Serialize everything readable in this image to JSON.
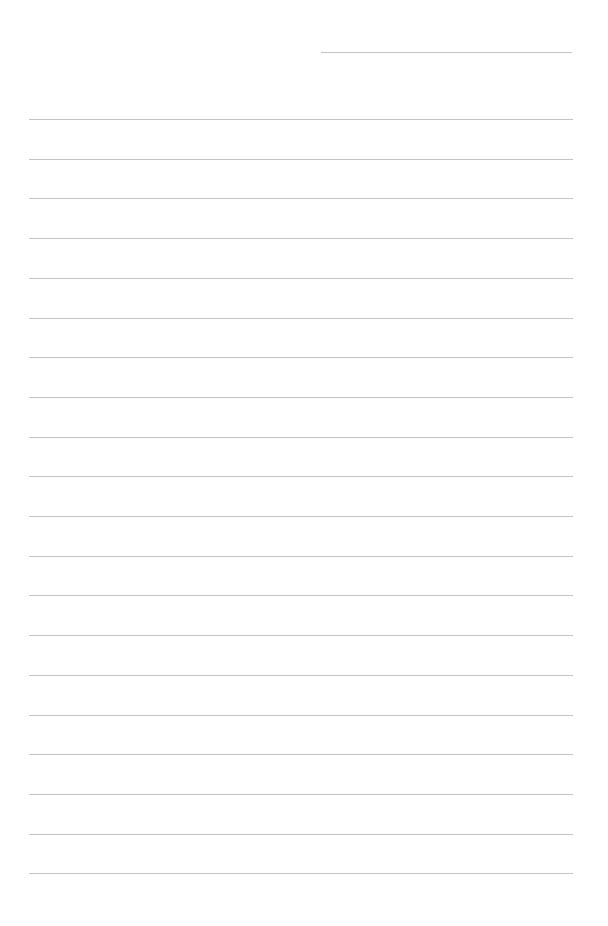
{
  "page": {
    "header_line": {
      "x1": 321,
      "x2": 572,
      "y": 52
    },
    "ruled_lines": {
      "count": 20,
      "x1": 29,
      "x2": 573,
      "first_y": 119,
      "spacing": 39.7
    },
    "line_color": "#b8b8b8",
    "background": "#ffffff"
  }
}
